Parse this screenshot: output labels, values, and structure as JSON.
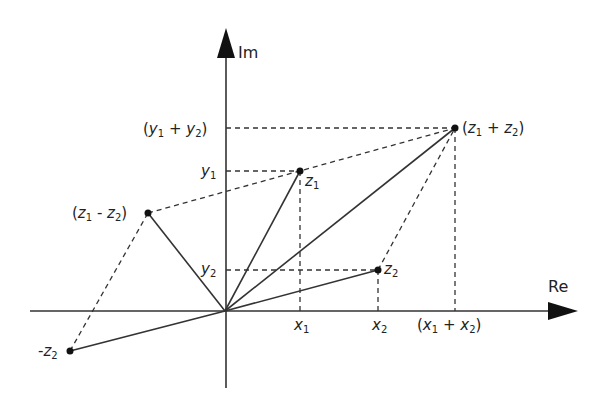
{
  "diagram": {
    "axes": {
      "real_label": "Re",
      "imag_label": "Im",
      "origin_px": [
        225,
        311
      ],
      "color": "#333333"
    },
    "points": [
      {
        "id": "z1",
        "label": "z",
        "sub": "1",
        "px": [
          300,
          171
        ]
      },
      {
        "id": "z2",
        "label": "z",
        "sub": "2",
        "px": [
          378,
          270
        ]
      },
      {
        "id": "z1_plus_z2",
        "label": "(z1 + z2)",
        "px": [
          455,
          128
        ]
      },
      {
        "id": "z1_minus_z2",
        "label": "(z1 - z2)",
        "px": [
          148,
          213
        ]
      },
      {
        "id": "neg_z2",
        "label": "-z2",
        "px": [
          70,
          351
        ]
      }
    ],
    "x_ticks": [
      {
        "label": "x",
        "sub": "1"
      },
      {
        "label": "x",
        "sub": "2"
      },
      {
        "label": "(x1 + x2)"
      }
    ],
    "y_ticks": [
      {
        "label": "y",
        "sub": "1"
      },
      {
        "label": "y",
        "sub": "2"
      },
      {
        "label": "(y1 + y2)"
      }
    ],
    "text": {
      "z": "z",
      "x": "x",
      "y": "y",
      "neg": "-",
      "plus": " + ",
      "minus": " - ",
      "open": "(",
      "close": ")",
      "s1": "1",
      "s2": "2"
    }
  }
}
